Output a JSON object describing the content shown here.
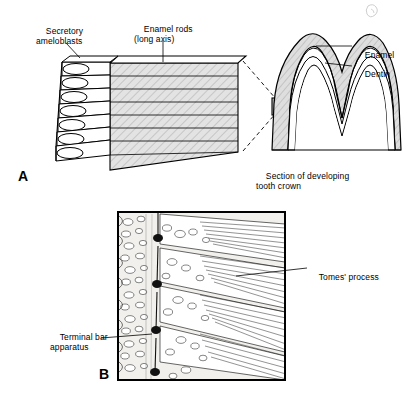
{
  "figure": {
    "panels": [
      {
        "letter": "A",
        "labels": [
          {
            "name": "label-secretory-ameloblasts",
            "text": "Secretory\nameloblasts",
            "x": 36,
            "y": 20
          },
          {
            "name": "label-enamel-rods",
            "text": "Enamel rods\n(long axis)",
            "x": 135,
            "y": 17
          },
          {
            "name": "label-enamel",
            "text": "Enamel",
            "x": 356,
            "y": 42
          },
          {
            "name": "label-dentin",
            "text": "Dentin",
            "x": 356,
            "y": 62
          },
          {
            "name": "label-section-of-developing-tooth-crown",
            "text": "Section of developing\ntooth crown",
            "x": 258,
            "y": 163
          }
        ]
      },
      {
        "letter": "B",
        "labels": [
          {
            "name": "label-tomes-process",
            "text": "Tomes' process",
            "x": 310,
            "y": 264
          },
          {
            "name": "label-terminal-bar-apparatus",
            "text": "Terminal bar\napparatus",
            "x": 55,
            "y": 324
          }
        ]
      }
    ],
    "colors": {
      "ink": "#000000",
      "background": "#ffffff",
      "enamel_fill": "#d8d8d8",
      "micrograph_fill": "#f2f0ec"
    }
  }
}
